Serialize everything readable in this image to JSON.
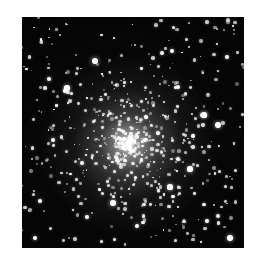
{
  "image": {
    "subject": "globular star cluster",
    "frame": {
      "left": 22,
      "top": 17,
      "width": 222,
      "height": 231
    },
    "background_color": "#050505",
    "core_center": {
      "x": 0.48,
      "y": 0.55
    }
  },
  "stars": {
    "seed": 7,
    "count_field": 260,
    "count_core": 420,
    "bright": [
      [
        73,
        44,
        3.2
      ],
      [
        150,
        34,
        2.4
      ],
      [
        196,
        108,
        3.0
      ],
      [
        45,
        71,
        2.6
      ],
      [
        31,
        123,
        2.2
      ],
      [
        91,
        186,
        2.8
      ],
      [
        115,
        209,
        2.4
      ],
      [
        168,
        152,
        2.6
      ],
      [
        60,
        146,
        2.4
      ],
      [
        205,
        40,
        2.2
      ],
      [
        182,
        98,
        2.6
      ],
      [
        18,
        184,
        2.4
      ],
      [
        148,
        170,
        2.6
      ],
      [
        208,
        221,
        2.8
      ],
      [
        102,
        122,
        2.2
      ],
      [
        27,
        62,
        2.4
      ],
      [
        156,
        70,
        2.2
      ],
      [
        65,
        200,
        2.4
      ],
      [
        185,
        204,
        2.2
      ],
      [
        13,
        221,
        2.4
      ]
    ]
  }
}
